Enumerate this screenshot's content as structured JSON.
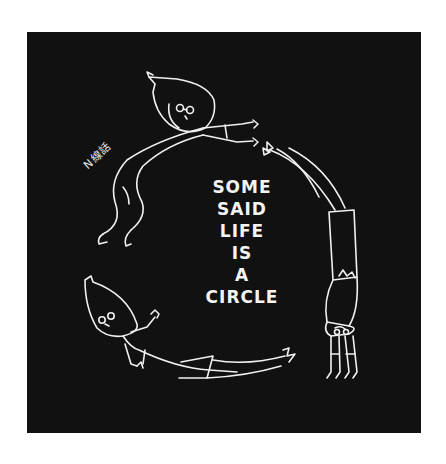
{
  "artwork": {
    "background_color": "#111111",
    "line_color": "#f0f0f0",
    "phrase_lines": [
      "SOME",
      "SAID",
      "LIFE",
      "IS",
      "A",
      "CIRCLE"
    ],
    "signature": "N線話",
    "figures": [
      {
        "name": "figure-top-left",
        "pose": "reaching right, diving"
      },
      {
        "name": "figure-right",
        "pose": "upside down, legs up"
      },
      {
        "name": "figure-bottom",
        "pose": "lying, arm raised"
      }
    ]
  }
}
